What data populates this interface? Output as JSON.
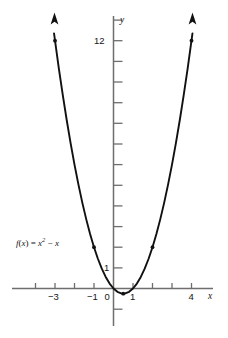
{
  "chart_data": {
    "type": "line",
    "title": "",
    "subtitle": "",
    "function_label": "f(x) = x² − x",
    "function_parts": {
      "f": "f",
      "paren_open": "(",
      "var1": "x",
      "paren_close": ")",
      "equals": " = ",
      "var2": "x",
      "exponent": "2",
      "minus": " − ",
      "var3": "x"
    },
    "equation": "y = x^2 - x",
    "xlabel": "x",
    "ylabel": "y",
    "xlim": [
      -4.6,
      5.0
    ],
    "ylim": [
      -1.9,
      13.6
    ],
    "grid": false,
    "legend": null,
    "x_ticks": [
      -4,
      -3,
      -2,
      -1,
      0,
      1,
      2,
      3,
      4
    ],
    "x_tick_labels": [
      {
        "value": -3,
        "label": "−3"
      },
      {
        "value": -1,
        "label": "−1"
      },
      {
        "value": 0,
        "label": "0"
      },
      {
        "value": 1,
        "label": "1"
      },
      {
        "value": 4,
        "label": "4"
      }
    ],
    "y_ticks": [
      -1,
      1,
      2,
      3,
      4,
      5,
      6,
      7,
      8,
      9,
      10,
      11,
      12,
      13
    ],
    "y_tick_labels": [
      {
        "value": 1,
        "label": "1"
      },
      {
        "value": 12,
        "label": "12"
      }
    ],
    "curve_color": "#111111",
    "axis_color": "#6e6e6e",
    "curve_width": 1.9,
    "arrows": [
      "up-left-end",
      "up-right-end"
    ],
    "points": [
      {
        "x": -3,
        "y": 12,
        "label": ""
      },
      {
        "x": -1,
        "y": 2,
        "label": ""
      },
      {
        "x": 0.5,
        "y": -0.25,
        "label": ""
      },
      {
        "x": 2,
        "y": 2,
        "label": ""
      },
      {
        "x": 4,
        "y": 12,
        "label": ""
      }
    ],
    "series": [
      {
        "name": "f(x) = x^2 - x",
        "x": [
          -3.05,
          -2.8,
          -2.6,
          -2.4,
          -2.2,
          -2.0,
          -1.8,
          -1.6,
          -1.4,
          -1.2,
          -1.0,
          -0.8,
          -0.6,
          -0.4,
          -0.2,
          0.0,
          0.2,
          0.4,
          0.5,
          0.6,
          0.8,
          1.0,
          1.2,
          1.4,
          1.6,
          1.8,
          2.0,
          2.2,
          2.4,
          2.6,
          2.8,
          3.0,
          3.2,
          3.4,
          3.6,
          3.8,
          4.05
        ],
        "values": [
          12.35,
          10.64,
          9.36,
          8.16,
          7.04,
          6.0,
          5.04,
          4.16,
          3.36,
          2.64,
          2.0,
          1.44,
          0.96,
          0.56,
          0.24,
          0.0,
          -0.16,
          -0.24,
          -0.25,
          -0.24,
          -0.16,
          0.0,
          0.24,
          0.56,
          0.96,
          1.44,
          2.0,
          2.64,
          3.36,
          4.16,
          5.04,
          6.0,
          7.04,
          8.16,
          9.36,
          10.64,
          12.35
        ]
      }
    ]
  }
}
